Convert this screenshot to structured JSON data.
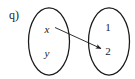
{
  "figure": {
    "label": "q)",
    "type": "mapping-diagram",
    "stroke_color": "#1a1a1a",
    "background_color": "#ffffff",
    "domain_oval": {
      "name": "domain-set",
      "elements": [
        {
          "id": "x",
          "label": "x",
          "style": "italic"
        },
        {
          "id": "y",
          "label": "y",
          "style": "italic"
        }
      ]
    },
    "codomain_oval": {
      "name": "codomain-set",
      "elements": [
        {
          "id": "1",
          "label": "1",
          "style": "normal"
        },
        {
          "id": "2",
          "label": "2",
          "style": "normal"
        }
      ]
    },
    "arrows": [
      {
        "from": "x",
        "to": "2",
        "kind": "mapping-arrow"
      }
    ]
  }
}
